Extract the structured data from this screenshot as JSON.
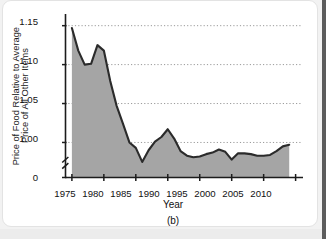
{
  "figure": {
    "panel_caption": "(b)",
    "xaxis_title": "Year",
    "yaxis_title_line1": "Price of Food Relative to Average",
    "yaxis_title_line2": "Price of All Other Items"
  },
  "colors": {
    "area_fill": "#a5a5a5",
    "line": "#2b2b2b",
    "axis": "#1c1c1c",
    "gridline": "#9a9a9a",
    "card_background": "#ffffff",
    "page_background": "#f2f2f2"
  },
  "chart_data": {
    "type": "area",
    "title": "",
    "subtitle": "",
    "xlabel": "Year",
    "ylabel": "Price of Food Relative to Average Price of All Other Items",
    "caption": "(b)",
    "xlim": [
      1974.0,
      2011.0
    ],
    "ylim": [
      0.955,
      1.165
    ],
    "axis_break": true,
    "axis_break_note": "y-axis broken between 0 and ~0.96",
    "grid": "horizontal dotted gridlines at y tick values",
    "legend": "none",
    "xticks": [
      1975,
      1980,
      1985,
      1990,
      1995,
      2000,
      2005,
      2010
    ],
    "xticklabels": [
      "1975",
      "1980",
      "1985",
      "1990",
      "1995",
      "2000",
      "2005",
      "2010"
    ],
    "yticks": [
      1.15,
      1.1,
      1.05,
      1.0,
      0
    ],
    "yticklabels": [
      "1.15",
      "1.10",
      "1.05",
      "1.00",
      "0"
    ],
    "series": [
      {
        "name": "Price of food relative to average price of all other items",
        "x": [
          1975,
          1976,
          1977,
          1978,
          1979,
          1980,
          1981,
          1982,
          1983,
          1984,
          1985,
          1986,
          1987,
          1988,
          1989,
          1990,
          1991,
          1992,
          1993,
          1994,
          1995,
          1996,
          1997,
          1998,
          1999,
          2000,
          2001,
          2002,
          2003,
          2004,
          2005,
          2006,
          2007,
          2008,
          2009
        ],
        "values": [
          1.147,
          1.118,
          1.1,
          1.101,
          1.125,
          1.118,
          1.079,
          1.047,
          1.024,
          1.0,
          0.993,
          0.975,
          0.99,
          1.001,
          1.007,
          1.017,
          1.005,
          0.989,
          0.983,
          0.981,
          0.982,
          0.985,
          0.987,
          0.991,
          0.988,
          0.978,
          0.986,
          0.986,
          0.985,
          0.983,
          0.983,
          0.984,
          0.989,
          0.995,
          0.997
        ]
      }
    ]
  }
}
